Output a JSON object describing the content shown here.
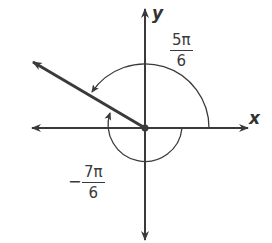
{
  "diagram": {
    "type": "coterminal-angles",
    "axes": {
      "x_label": "x",
      "y_label": "y"
    },
    "angles": [
      {
        "name": "positive",
        "numerator": "5π",
        "denominator": "6",
        "sign": "",
        "direction": "counterclockwise"
      },
      {
        "name": "negative",
        "numerator": "7π",
        "denominator": "6",
        "sign": "−",
        "direction": "clockwise"
      }
    ],
    "colors": {
      "stroke": "#3a3a3a",
      "background": "#ffffff"
    }
  }
}
